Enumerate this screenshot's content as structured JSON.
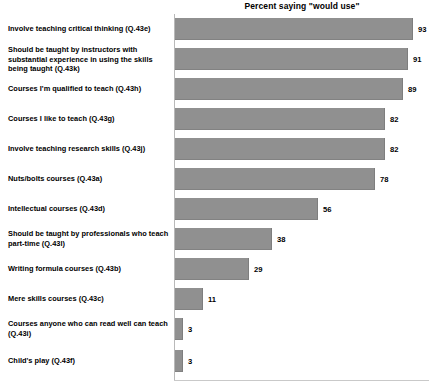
{
  "chart_data": {
    "type": "bar",
    "orientation": "horizontal",
    "title": "Percent saying \"would use\"",
    "xlabel": "",
    "ylabel": "",
    "xlim": [
      0,
      100
    ],
    "grid": false,
    "legend": null,
    "bar_color": "#909090",
    "categories": [
      "Involve teaching critical thinking (Q.43e)",
      "Should be taught by instructors with substantial experience in using the skills being taught  (Q.43k)",
      "Courses I'm qualified to teach (Q.43h)",
      "Courses I like to teach (Q.43g)",
      "Involve teaching research skills (Q.43j)",
      "Nuts/bolts courses (Q.43a)",
      "Intellectual courses (Q.43d)",
      "Should be taught by professionals who teach part-time  (Q.43l)",
      "Writing formula courses (Q.43b)",
      "Mere skills courses (Q.43c)",
      "Courses anyone who can read well can teach (Q.43i)",
      "Child's play  (Q.43f)"
    ],
    "values": [
      93,
      91,
      89,
      82,
      82,
      78,
      56,
      38,
      29,
      11,
      3,
      3
    ],
    "value_labels": [
      "93",
      "91",
      "89",
      "82",
      "82",
      "78",
      "56",
      "38",
      "29",
      "11",
      "3",
      "3"
    ]
  }
}
